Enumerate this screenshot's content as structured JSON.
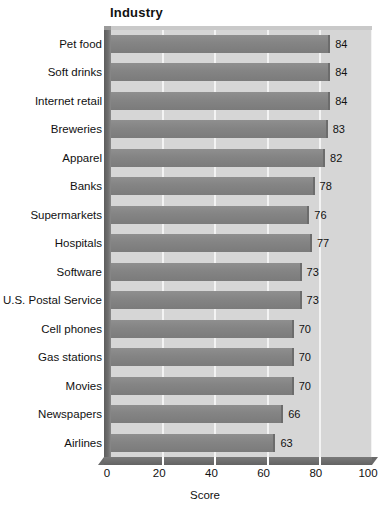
{
  "chart_data": {
    "type": "bar",
    "orientation": "horizontal",
    "title": "Industry",
    "xlabel": "Score",
    "ylabel": "",
    "xlim": [
      0,
      100
    ],
    "xticks": [
      0,
      20,
      40,
      60,
      80,
      100
    ],
    "grid": "vertical",
    "legend": "none",
    "show_value_labels": true,
    "categories": [
      "Pet food",
      "Soft drinks",
      "Internet retail",
      "Breweries",
      "Apparel",
      "Banks",
      "Supermarkets",
      "Hospitals",
      "Software",
      "U.S. Postal Service",
      "Cell phones",
      "Gas stations",
      "Movies",
      "Newspapers",
      "Airlines"
    ],
    "values": [
      84,
      84,
      84,
      83,
      82,
      78,
      76,
      77,
      73,
      73,
      70,
      70,
      70,
      66,
      63
    ],
    "colors": {
      "bar": "#848484",
      "plot_background": "#d6d6d6",
      "gridline": "#f3f3f3",
      "axis_wall": "#6f6f6f",
      "text": "#111111",
      "page_background": "#ffffff"
    }
  }
}
